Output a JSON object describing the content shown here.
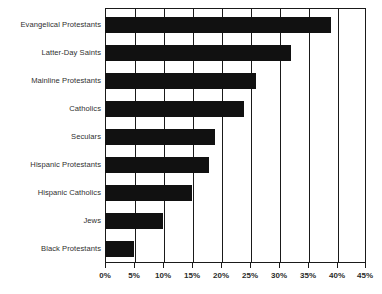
{
  "chart_data": {
    "type": "bar",
    "orientation": "horizontal",
    "title": "",
    "subtitle": "",
    "xlabel": "",
    "ylabel": "",
    "categories": [
      "Evangelical Protestants",
      "Latter-Day Saints",
      "Mainline Protestants",
      "Catholics",
      "Seculars",
      "Hispanic Protestants",
      "Hispanic Catholics",
      "Jews",
      "Black Protestants"
    ],
    "values": [
      39,
      32,
      26,
      24,
      19,
      18,
      15,
      10,
      5
    ],
    "value_labels": [
      "39%",
      "32%",
      "26%",
      "24%",
      "19%",
      "18%",
      "15%",
      "10%",
      "5%"
    ],
    "xlim": [
      0,
      45
    ],
    "xticks": [
      0,
      5,
      10,
      15,
      20,
      25,
      30,
      35,
      40,
      45
    ],
    "xtick_labels": [
      "0%",
      "5%",
      "10%",
      "15%",
      "20%",
      "25%",
      "30%",
      "35%",
      "40%",
      "45%"
    ],
    "grid": "vertical",
    "legend": "none",
    "bar_color": "#111111",
    "axis_color": "#1a1a1a",
    "background_color": "#ffffff"
  },
  "footer": {
    "caption": ""
  }
}
